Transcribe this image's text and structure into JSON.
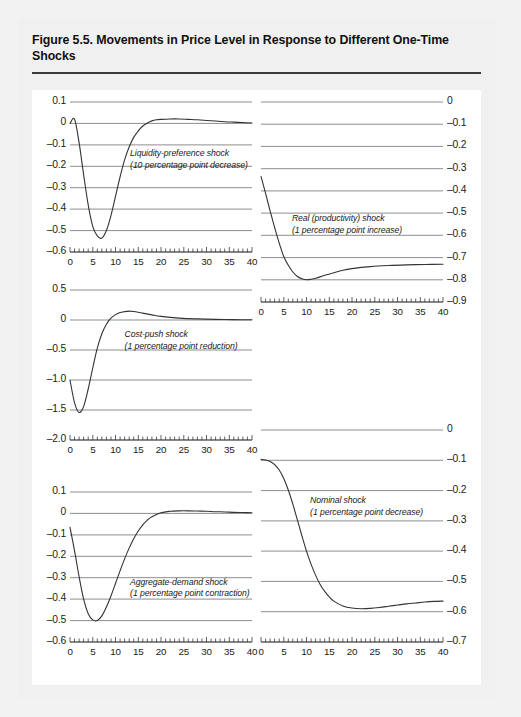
{
  "figure": {
    "title": "Figure 5.5. Movements in Price Level in Response to Different One-Time Shocks",
    "source": "Source: IMF staff estimates."
  },
  "chart_data": [
    {
      "id": "liquidity-preference",
      "type": "line",
      "title": "",
      "annotation_line1": "Liquidity-preference shock",
      "annotation_line2": "(10 percentage point decrease)",
      "axis_side": "left",
      "xlabel": "",
      "ylabel": "",
      "xlim": [
        0,
        40
      ],
      "ylim": [
        -0.6,
        0.1
      ],
      "xticks": [
        0,
        5,
        10,
        15,
        20,
        25,
        30,
        35,
        40
      ],
      "xticklabels": [
        "0",
        "5",
        "10",
        "15",
        "20",
        "25",
        "30",
        "35",
        "40"
      ],
      "yticks": [
        0.1,
        0,
        -0.1,
        -0.2,
        -0.3,
        -0.4,
        -0.5,
        -0.6
      ],
      "yticklabels": [
        "0.1",
        "0",
        "–0.1",
        "–0.2",
        "–0.3",
        "–0.4",
        "–0.5",
        "–0.6"
      ],
      "grid": true,
      "x": [
        0,
        1,
        2,
        3,
        4,
        5,
        6,
        7,
        8,
        9,
        10,
        11,
        12,
        13,
        14,
        15,
        16,
        17,
        18,
        19,
        20,
        22,
        24,
        26,
        28,
        30,
        32,
        34,
        36,
        38,
        40
      ],
      "values": [
        0.0,
        0.02,
        -0.09,
        -0.24,
        -0.38,
        -0.48,
        -0.525,
        -0.535,
        -0.5,
        -0.43,
        -0.34,
        -0.25,
        -0.17,
        -0.11,
        -0.065,
        -0.035,
        -0.012,
        0.002,
        0.012,
        0.017,
        0.019,
        0.021,
        0.021,
        0.019,
        0.017,
        0.014,
        0.011,
        0.008,
        0.006,
        0.004,
        0.002
      ]
    },
    {
      "id": "real-productivity",
      "type": "line",
      "title": "",
      "annotation_line1": "Real (productivity) shock",
      "annotation_line2": "(1 percentage point increase)",
      "axis_side": "right",
      "xlabel": "",
      "ylabel": "",
      "xlim": [
        0,
        40
      ],
      "ylim": [
        -0.9,
        0
      ],
      "xticks": [
        0,
        5,
        10,
        15,
        20,
        25,
        30,
        35,
        40
      ],
      "xticklabels": [
        "0",
        "5",
        "10",
        "15",
        "20",
        "25",
        "30",
        "35",
        "40"
      ],
      "yticks": [
        0,
        -0.1,
        -0.2,
        -0.3,
        -0.4,
        -0.5,
        -0.6,
        -0.7,
        -0.8,
        -0.9
      ],
      "yticklabels": [
        "0",
        "–0.1",
        "–0.2",
        "–0.3",
        "–0.4",
        "–0.5",
        "–0.6",
        "–0.7",
        "–0.8",
        "–0.9"
      ],
      "grid": true,
      "x": [
        0,
        1,
        2,
        3,
        4,
        5,
        6,
        7,
        8,
        9,
        10,
        11,
        12,
        13,
        14,
        16,
        18,
        20,
        24,
        28,
        32,
        36,
        40
      ],
      "values": [
        -0.335,
        -0.41,
        -0.49,
        -0.565,
        -0.635,
        -0.695,
        -0.735,
        -0.765,
        -0.785,
        -0.795,
        -0.8,
        -0.798,
        -0.793,
        -0.787,
        -0.78,
        -0.768,
        -0.757,
        -0.75,
        -0.741,
        -0.736,
        -0.733,
        -0.731,
        -0.73
      ]
    },
    {
      "id": "cost-push",
      "type": "line",
      "title": "",
      "annotation_line1": "Cost-push shock",
      "annotation_line2": "(1 percentage point reduction)",
      "axis_side": "left",
      "xlabel": "",
      "ylabel": "",
      "xlim": [
        0,
        40
      ],
      "ylim": [
        -2.0,
        0.5
      ],
      "xticks": [
        0,
        5,
        10,
        15,
        20,
        25,
        30,
        35,
        40
      ],
      "xticklabels": [
        "0",
        "5",
        "10",
        "15",
        "20",
        "25",
        "30",
        "35",
        "40"
      ],
      "yticks": [
        0.5,
        0,
        -0.5,
        -1.0,
        -1.5,
        -2.0
      ],
      "yticklabels": [
        "0.5",
        "0",
        "–0.5",
        "–1.0",
        "–1.5",
        "–2.0"
      ],
      "grid": true,
      "x": [
        0,
        1,
        2,
        3,
        4,
        5,
        6,
        7,
        8,
        9,
        10,
        11,
        12,
        13,
        14,
        15,
        16,
        18,
        20,
        24,
        28,
        32,
        36,
        40
      ],
      "values": [
        -1.0,
        -1.38,
        -1.54,
        -1.44,
        -1.15,
        -0.8,
        -0.47,
        -0.23,
        -0.07,
        0.03,
        0.09,
        0.125,
        0.14,
        0.148,
        0.142,
        0.13,
        0.115,
        0.085,
        0.06,
        0.032,
        0.018,
        0.01,
        0.006,
        0.003
      ]
    },
    {
      "id": "nominal",
      "type": "line",
      "title": "",
      "annotation_line1": "Nominal shock",
      "annotation_line2": "(1 percentage point decrease)",
      "axis_side": "right",
      "xlabel": "",
      "ylabel": "",
      "xlim": [
        0,
        40
      ],
      "ylim": [
        -0.7,
        0
      ],
      "xticks": [
        0,
        5,
        10,
        15,
        20,
        25,
        30,
        35,
        40
      ],
      "xticklabels": [
        "0",
        "5",
        "10",
        "15",
        "20",
        "25",
        "30",
        "35",
        "40"
      ],
      "yticks": [
        0,
        -0.1,
        -0.2,
        -0.3,
        -0.4,
        -0.5,
        -0.6,
        -0.7
      ],
      "yticklabels": [
        "0",
        "–0.1",
        "–0.2",
        "–0.3",
        "–0.4",
        "–0.5",
        "–0.6",
        "–0.7"
      ],
      "grid": true,
      "x": [
        0,
        1,
        2,
        3,
        4,
        5,
        6,
        7,
        8,
        9,
        10,
        11,
        12,
        13,
        14,
        15,
        16,
        18,
        20,
        22,
        24,
        26,
        28,
        30,
        32,
        34,
        36,
        38,
        40
      ],
      "values": [
        -0.097,
        -0.099,
        -0.104,
        -0.114,
        -0.132,
        -0.16,
        -0.198,
        -0.245,
        -0.297,
        -0.35,
        -0.4,
        -0.443,
        -0.48,
        -0.51,
        -0.533,
        -0.551,
        -0.565,
        -0.581,
        -0.588,
        -0.59,
        -0.589,
        -0.586,
        -0.582,
        -0.578,
        -0.574,
        -0.571,
        -0.568,
        -0.566,
        -0.565
      ]
    },
    {
      "id": "aggregate-demand",
      "type": "line",
      "title": "",
      "annotation_line1": "Aggregate-demand shock",
      "annotation_line2": "(1 percentage point contraction)",
      "axis_side": "left",
      "xlabel": "",
      "ylabel": "",
      "xlim": [
        0,
        40
      ],
      "ylim": [
        -0.6,
        0.1
      ],
      "xticks": [
        0,
        5,
        10,
        15,
        20,
        25,
        30,
        35,
        40
      ],
      "xticklabels": [
        "0",
        "5",
        "10",
        "15",
        "20",
        "25",
        "30",
        "35",
        "40"
      ],
      "yticks": [
        0.1,
        0,
        -0.1,
        -0.2,
        -0.3,
        -0.4,
        -0.5,
        -0.6
      ],
      "yticklabels": [
        "0.1",
        "0",
        "–0.1",
        "–0.2",
        "–0.3",
        "–0.4",
        "–0.5",
        "–0.6"
      ],
      "grid": true,
      "x": [
        0,
        1,
        2,
        3,
        4,
        5,
        6,
        7,
        8,
        9,
        10,
        11,
        12,
        13,
        14,
        15,
        16,
        17,
        18,
        20,
        22,
        24,
        26,
        28,
        30,
        32,
        34,
        36,
        38,
        40
      ],
      "values": [
        -0.065,
        -0.175,
        -0.295,
        -0.4,
        -0.468,
        -0.497,
        -0.5,
        -0.478,
        -0.437,
        -0.385,
        -0.327,
        -0.268,
        -0.212,
        -0.162,
        -0.118,
        -0.082,
        -0.053,
        -0.031,
        -0.016,
        0.003,
        0.01,
        0.012,
        0.012,
        0.011,
        0.01,
        0.008,
        0.007,
        0.005,
        0.004,
        0.003
      ]
    }
  ]
}
